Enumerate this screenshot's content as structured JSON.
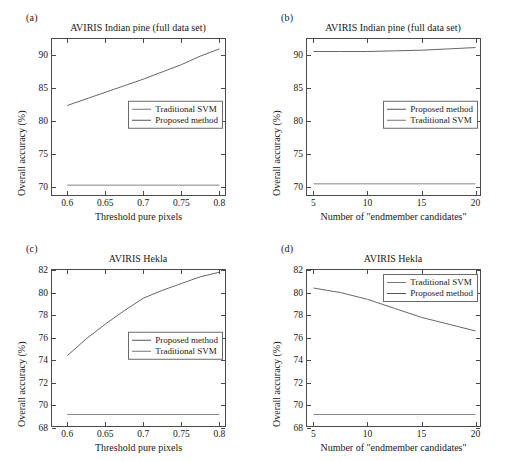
{
  "figure": {
    "width": 509,
    "height": 461,
    "background": "#ffffff",
    "line_color_proposed": "#555555",
    "line_color_svm": "#777777",
    "axis_color": "#4a4a4a"
  },
  "panels": [
    {
      "key": "a",
      "label": "(a)",
      "title": "AVIRIS Indian pine (full data set)",
      "legend_items": [
        "Traditional SVM",
        "Proposed method"
      ]
    },
    {
      "key": "b",
      "label": "(b)",
      "title": "AVIRIS Indian pine (full data set)",
      "legend_items": [
        "Proposed method",
        "Traditional SVM"
      ]
    },
    {
      "key": "c",
      "label": "(c)",
      "title": "AVIRIS Hekla",
      "legend_items": [
        "Proposed method",
        "Traditional SVM"
      ]
    },
    {
      "key": "d",
      "label": "(d)",
      "title": "AVIRIS Hekla",
      "legend_items": [
        "Traditional SVM",
        "Proposed method"
      ]
    }
  ],
  "chart_data": [
    {
      "panel": "a",
      "type": "line",
      "title": "AVIRIS Indian pine (full data set)",
      "xlabel": "Threshold pure pixels",
      "ylabel": "Overall accuracy (%)",
      "xlim": [
        0.58,
        0.81
      ],
      "ylim": [
        68.5,
        92.5
      ],
      "xticks": [
        0.6,
        0.65,
        0.7,
        0.75,
        0.8
      ],
      "xticklabels": [
        "0.6",
        "0.65",
        "0.7",
        "0.75",
        "0.8"
      ],
      "yticks": [
        70,
        75,
        80,
        85,
        90
      ],
      "yticklabels": [
        "70",
        "75",
        "80",
        "85",
        "90"
      ],
      "grid": false,
      "legend_position": "center-right",
      "series": [
        {
          "name": "Proposed method",
          "x": [
            0.6,
            0.625,
            0.65,
            0.675,
            0.7,
            0.725,
            0.75,
            0.775,
            0.8
          ],
          "values": [
            82.4,
            83.4,
            84.4,
            85.4,
            86.4,
            87.5,
            88.6,
            89.9,
            91.0
          ]
        },
        {
          "name": "Traditional SVM",
          "x": [
            0.6,
            0.8
          ],
          "values": [
            70.3,
            70.3
          ]
        }
      ]
    },
    {
      "panel": "b",
      "type": "line",
      "title": "AVIRIS Indian pine (full data set)",
      "xlabel": "Number of \"endmember candidates\"",
      "ylabel": "Overall accuracy (%)",
      "xlim": [
        4.4,
        20.6
      ],
      "ylim": [
        68.5,
        92.5
      ],
      "xticks": [
        5,
        10,
        15,
        20
      ],
      "xticklabels": [
        "5",
        "10",
        "15",
        "20"
      ],
      "yticks": [
        70,
        75,
        80,
        85,
        90
      ],
      "yticklabels": [
        "70",
        "75",
        "80",
        "85",
        "90"
      ],
      "grid": false,
      "legend_position": "center-right",
      "series": [
        {
          "name": "Proposed method",
          "x": [
            5,
            7.5,
            10,
            12.5,
            15,
            17.5,
            20
          ],
          "values": [
            90.6,
            90.6,
            90.6,
            90.7,
            90.8,
            91.0,
            91.2
          ]
        },
        {
          "name": "Traditional SVM",
          "x": [
            5,
            20
          ],
          "values": [
            70.5,
            70.5
          ]
        }
      ]
    },
    {
      "panel": "c",
      "type": "line",
      "title": "AVIRIS Hekla",
      "xlabel": "Threshold pure pixels",
      "ylabel": "Overall accuracy (%)",
      "xlim": [
        0.58,
        0.81
      ],
      "ylim": [
        68,
        82
      ],
      "xticks": [
        0.6,
        0.65,
        0.7,
        0.75,
        0.8
      ],
      "xticklabels": [
        "0.6",
        "0.65",
        "0.7",
        "0.75",
        "0.8"
      ],
      "yticks": [
        68,
        70,
        72,
        74,
        76,
        78,
        80,
        82
      ],
      "yticklabels": [
        "68",
        "70",
        "72",
        "74",
        "76",
        "78",
        "80",
        "82"
      ],
      "grid": false,
      "legend_position": "center-right",
      "series": [
        {
          "name": "Proposed method",
          "x": [
            0.6,
            0.625,
            0.65,
            0.675,
            0.7,
            0.725,
            0.75,
            0.775,
            0.8
          ],
          "values": [
            74.4,
            75.9,
            77.2,
            78.4,
            79.5,
            80.2,
            80.8,
            81.4,
            81.8
          ]
        },
        {
          "name": "Traditional SVM",
          "x": [
            0.6,
            0.8
          ],
          "values": [
            69.2,
            69.2
          ]
        }
      ]
    },
    {
      "panel": "d",
      "type": "line",
      "title": "AVIRIS Hekla",
      "xlabel": "Number of \"endmember candidates\"",
      "ylabel": "Overall accuracy (%)",
      "xlim": [
        4.4,
        20.6
      ],
      "ylim": [
        68,
        82
      ],
      "xticks": [
        5,
        10,
        15,
        20
      ],
      "xticklabels": [
        "5",
        "10",
        "15",
        "20"
      ],
      "yticks": [
        68,
        70,
        72,
        74,
        76,
        78,
        80,
        82
      ],
      "yticklabels": [
        "68",
        "70",
        "72",
        "74",
        "76",
        "78",
        "80",
        "82"
      ],
      "grid": false,
      "legend_position": "top-right",
      "series": [
        {
          "name": "Proposed method",
          "x": [
            5,
            7.5,
            10,
            12.5,
            15,
            17.5,
            20
          ],
          "values": [
            80.4,
            80.0,
            79.4,
            78.6,
            77.8,
            77.2,
            76.6
          ]
        },
        {
          "name": "Traditional SVM",
          "x": [
            5,
            20
          ],
          "values": [
            69.2,
            69.2
          ]
        }
      ]
    }
  ]
}
